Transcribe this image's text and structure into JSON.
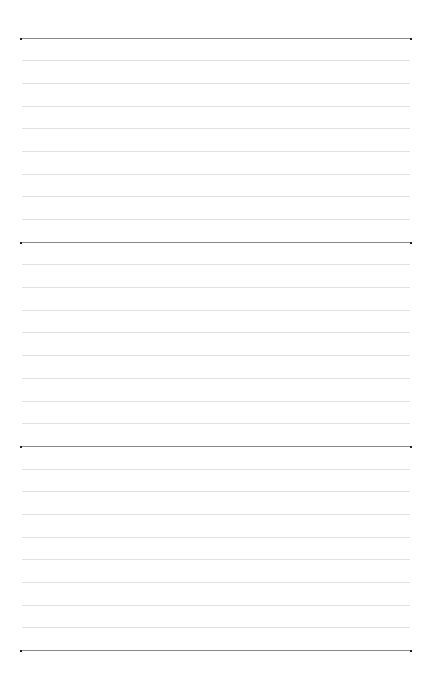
{
  "page": {
    "type": "lined-paper",
    "sections": 3,
    "lines_per_section": 8,
    "dark_rule_positions": [
      37.5,
      241.5,
      446,
      650
    ],
    "line_spacing": 22.7,
    "rule_x_start": 21,
    "rule_x_end": 411,
    "colors": {
      "background": "#ffffff",
      "light_rule": "#e2e2e2",
      "dark_rule": "#8a8a8a",
      "end_dot": "#222222"
    }
  }
}
